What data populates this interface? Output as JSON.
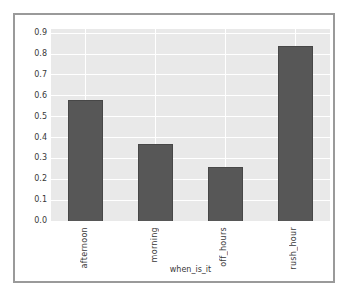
{
  "chart_data": {
    "type": "bar",
    "categories": [
      "afternoon",
      "morning",
      "off_hours",
      "rush_hour"
    ],
    "values": [
      0.58,
      0.37,
      0.26,
      0.84
    ],
    "title": "",
    "xlabel": "when_is_it",
    "ylabel": "",
    "ylim": [
      0,
      0.92
    ],
    "yticks": [
      0.0,
      0.1,
      0.2,
      0.3,
      0.4,
      0.5,
      0.6,
      0.7,
      0.8,
      0.9
    ],
    "ytick_labels": [
      "0.0",
      "0.1",
      "0.2",
      "0.3",
      "0.4",
      "0.5",
      "0.6",
      "0.7",
      "0.8",
      "0.9"
    ],
    "grid": true,
    "legend": "none",
    "bar_color": "#575757",
    "bar_edge_color": "#474747",
    "plot_background": "#e9e9e9",
    "grid_color": "#ffffff",
    "tick_label_color": "#383838",
    "figure_border_color": "#9a9a9a",
    "figure_background": "#ffffff"
  }
}
